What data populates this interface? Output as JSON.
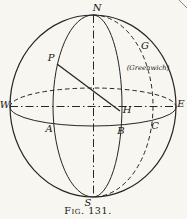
{
  "figure": {
    "caption": "Fig. 131.",
    "colors": {
      "paper": "#f8f6f1",
      "ink": "#262626",
      "label": "#141414",
      "artifact": "#8a8a8a"
    },
    "labels": [
      {
        "name": "label-north-pole",
        "text": "N",
        "x": 97,
        "y": 8,
        "size": 10
      },
      {
        "name": "label-south-pole",
        "text": "S",
        "x": 88,
        "y": 203,
        "size": 10
      },
      {
        "name": "label-west",
        "text": "W",
        "x": 5,
        "y": 105,
        "size": 10
      },
      {
        "name": "label-east",
        "text": "E",
        "x": 181,
        "y": 104,
        "size": 10
      },
      {
        "name": "label-point-p",
        "text": "P",
        "x": 51,
        "y": 58,
        "size": 10
      },
      {
        "name": "label-point-g",
        "text": "G",
        "x": 145,
        "y": 46,
        "size": 10
      },
      {
        "name": "label-greenwich",
        "text": "(Greenwich)",
        "x": 148,
        "y": 68,
        "size": 6.8
      },
      {
        "name": "label-point-h",
        "text": "H",
        "x": 127,
        "y": 110,
        "size": 10
      },
      {
        "name": "label-point-a",
        "text": "A",
        "x": 49,
        "y": 129,
        "size": 10
      },
      {
        "name": "label-point-b",
        "text": "B",
        "x": 121,
        "y": 131,
        "size": 10
      },
      {
        "name": "label-point-c",
        "text": "C",
        "x": 155,
        "y": 126,
        "size": 10
      }
    ],
    "geometry": {
      "cx": 93,
      "cy": 106,
      "outline": {
        "rx": 83,
        "ry": 91
      },
      "equator": {
        "cy": 107,
        "rx": 83,
        "ry": 19
      },
      "meridians": [
        {
          "name": "meridian-p-arc",
          "rx": 40,
          "side": "left",
          "dashed": false
        },
        {
          "name": "meridian-b-arc",
          "rx": 29,
          "side": "right",
          "dashed": false
        },
        {
          "name": "greenwich-meridian-arc",
          "rx": 60,
          "side": "right",
          "dashed": true
        }
      ],
      "axis_horizontal": {
        "x1": 10,
        "y1": 106.5,
        "x2": 176,
        "y2": 106.5
      },
      "axis_vertical": {
        "x1": 93.5,
        "y1": 15,
        "x2": 93.5,
        "y2": 197
      },
      "line_ph": {
        "x1": 57,
        "y1": 64,
        "x2": 120,
        "y2": 111
      },
      "artifact": {
        "x1": 179,
        "y1": 0,
        "x2": 187,
        "y2": 8
      },
      "caption_pos": {
        "x": 88,
        "y": 214,
        "size": 9.5
      }
    }
  }
}
